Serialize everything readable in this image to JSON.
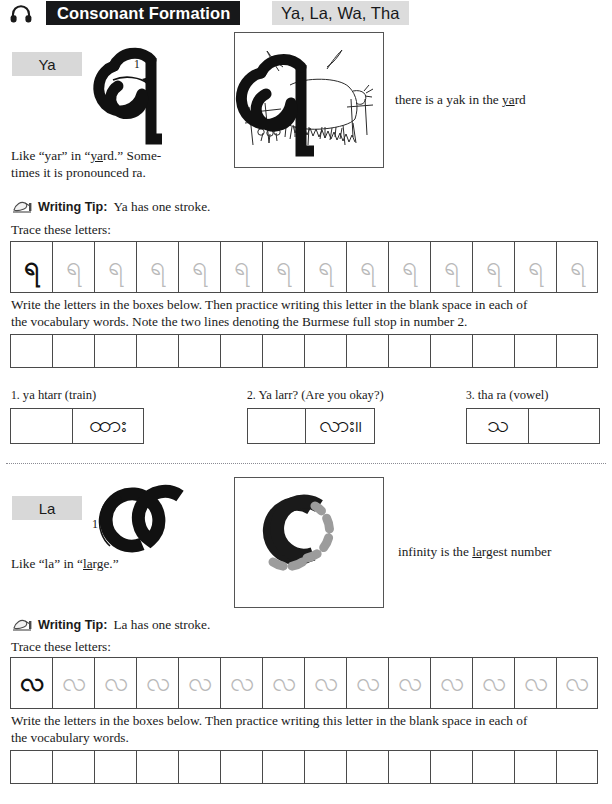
{
  "header": {
    "icon": "headphones-icon",
    "title": "Consonant Formation",
    "subtitle": "Ya, La, Wa, Tha"
  },
  "sections": [
    {
      "id": "ya",
      "chip_label": "Ya",
      "stroke_number": "1",
      "glyph": "ရ",
      "caption": "there is a yak in the yard",
      "caption_plain": "there is a yak in the ",
      "caption_underlined": "ya",
      "caption_tail": "rd",
      "pronunciation_line1": "Like “yar” in “yard.” Some-",
      "pronunciation_line2": "times it is pronounced ra.",
      "pronunciation_underline": "ya",
      "tip_icon": "writing-hand-icon",
      "tip_label": "Writing Tip:",
      "tip_text": "Ya has one stroke.",
      "trace_prompt": "Trace these letters:",
      "trace_count": 14,
      "write_prompt_line1": "Write the letters in the boxes below. Then practice writing this letter in the blank space in each of",
      "write_prompt_line2": "the vocabulary words. Note the two lines denoting the Burmese full stop in number 2.",
      "write_count": 14,
      "vocabulary": [
        {
          "number": "1.",
          "label": "ya htarr (train)",
          "burmese": "ထား",
          "blank_side": "left"
        },
        {
          "number": "2.",
          "label": "Ya larr? (Are you okay?)",
          "burmese": "လား။",
          "blank_side": "left"
        },
        {
          "number": "3.",
          "label": "tha ra (vowel)",
          "burmese": "သ",
          "blank_side": "right"
        }
      ]
    },
    {
      "id": "la",
      "chip_label": "La",
      "stroke_number": "1",
      "glyph": "လ",
      "caption_plain": "infinity is the ",
      "caption_underlined": "la",
      "caption_tail": "rgest number",
      "caption": "infinity is the largest number",
      "pronunciation_line1": "Like “la” in “large.”",
      "pronunciation_underline": "la",
      "tip_icon": "writing-hand-icon",
      "tip_label": "Writing Tip:",
      "tip_text": "La has one stroke.",
      "trace_prompt": "Trace these letters:",
      "trace_count": 14,
      "write_prompt_line1": "Write the letters in the boxes below. Then practice writing this letter in the blank space in each of",
      "write_prompt_line2": "the vocabulary words.",
      "write_count": 14
    }
  ],
  "colors": {
    "banner_bg": "#17181a",
    "subtitle_bg": "#dcdcdc",
    "chip_bg": "#d8d8d8",
    "ink": "#111111",
    "trace_ghost": "#b9b9b9",
    "box_border": "#4a4a4a"
  }
}
